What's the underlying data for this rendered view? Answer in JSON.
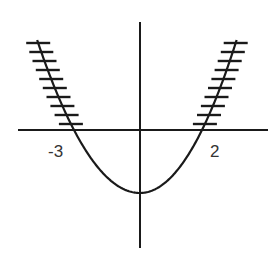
{
  "figure": {
    "colors": {
      "line": "#1a1a1a",
      "label": "#333333",
      "background": "#ffffff"
    },
    "x_axis": {
      "y": 130,
      "x1": 18,
      "x2": 268
    },
    "y_axis": {
      "x": 140,
      "y1": 22,
      "y2": 248
    },
    "roots": [
      {
        "label": "-3",
        "x": 74,
        "label_x": 48,
        "label_y": 157
      },
      {
        "label": "2",
        "x": 202,
        "label_x": 210,
        "label_y": 157
      }
    ],
    "vertex": {
      "x": 140,
      "y": 193
    },
    "branch_top_y": 40,
    "hatch_count": 10,
    "hatch_half_width": 12
  },
  "chart_data": {
    "type": "line",
    "title": "",
    "xlabel": "",
    "ylabel": "",
    "x_tick_labels": [
      "-3",
      "2"
    ],
    "series": [
      {
        "name": "parabola",
        "shape": "upward parabola",
        "roots": [
          -3,
          2
        ],
        "shaded_regions": [
          "x <= -3 (branch above x-axis)",
          "x >= 2 (branch above x-axis)"
        ]
      }
    ],
    "grid": false,
    "legend": null
  }
}
